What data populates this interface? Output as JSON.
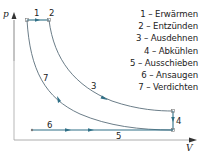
{
  "diagram": {
    "axes": {
      "y_label": "p",
      "x_label": "V"
    },
    "colors": {
      "process_line": "#2f6f86",
      "curve": "#5a6e7a",
      "axis": "#7a7a7a",
      "text": "#222222"
    },
    "point_labels": {
      "p1": "1",
      "p2": "2",
      "p3": "3",
      "p4": "4",
      "p5": "5",
      "p6": "6",
      "p7": "7"
    },
    "legend": [
      "1 – Erwärmen",
      "2 – Entzünden",
      "3 – Ausdehnen",
      "4 – Abkühlen",
      "5 – Ausschieben",
      "6 – Ansaugen",
      "7 – Verdichten"
    ]
  }
}
